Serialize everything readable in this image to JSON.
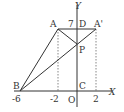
{
  "diagram": {
    "axes": {
      "x_label": "X",
      "y_label": "Y",
      "origin_label": "O"
    },
    "points": {
      "A": {
        "label": "A",
        "coord": [
          -2,
          7
        ]
      },
      "A_prime": {
        "label": "A'",
        "coord": [
          2,
          7
        ]
      },
      "B": {
        "label": "B",
        "coord": [
          -6,
          0
        ]
      },
      "C": {
        "label": "C",
        "coord": [
          0,
          0
        ]
      },
      "D": {
        "label": "D",
        "coord": [
          0,
          7
        ]
      },
      "P": {
        "label": "P"
      }
    },
    "tick_labels": {
      "x_neg6": "-6",
      "x_neg2": "-2",
      "x_2": "2",
      "y_7": "7"
    },
    "segments": [
      "AB",
      "A'B",
      "AA'",
      "AP"
    ],
    "dashed": [
      "A to x-axis",
      "A' to x-axis"
    ],
    "line_color": "#333333"
  }
}
